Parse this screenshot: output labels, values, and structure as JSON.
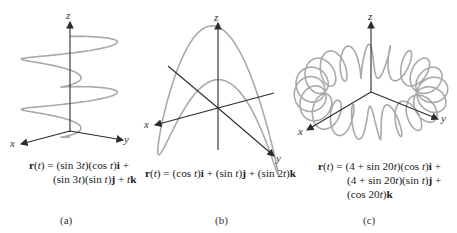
{
  "figure": {
    "panels": [
      {
        "id": "a",
        "caption": "(a)",
        "formula_lines": [
          "r(t) = (sin 3t)(cos t)i +",
          "(sin 3t)(sin t)j + tk"
        ],
        "axes": {
          "x": "x",
          "y": "y",
          "z": "z"
        },
        "curve": "helix-like: (sin 3t)(cos t), (sin 3t)(sin t), t"
      },
      {
        "id": "b",
        "caption": "(b)",
        "formula_lines": [
          "r(t) = (cos t)i + (sin t)j + (sin 2t)k"
        ],
        "axes": {
          "x": "x",
          "y": "y",
          "z": "z"
        },
        "curve": "saddle loop: cos t, sin t, sin 2t"
      },
      {
        "id": "c",
        "caption": "(c)",
        "formula_lines": [
          "r(t) = (4 + sin 20t)(cos t)i +",
          "(4 + sin 20t)(sin t)j +",
          "(cos 20t)k"
        ],
        "axes": {
          "x": "x",
          "y": "y",
          "z": "z"
        },
        "curve": "toroidal spiral: (4+sin20t)cos t, (4+sin20t)sin t, cos20t"
      }
    ],
    "colors": {
      "curve": "#a9a9a9",
      "axis": "#2b2b2b",
      "text": "#222222"
    }
  }
}
